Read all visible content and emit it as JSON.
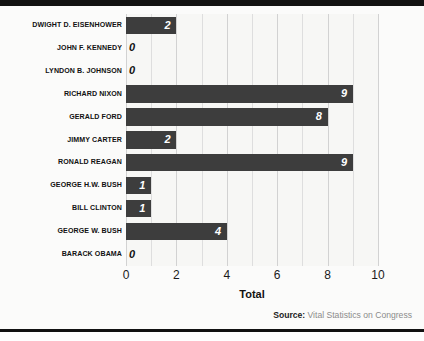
{
  "chart_data": {
    "type": "bar",
    "orientation": "horizontal",
    "title": "",
    "xlabel": "Total",
    "ylabel": "",
    "xlim": [
      0,
      10
    ],
    "grid": true,
    "legend": false,
    "categories": [
      "DWIGHT D. EISENHOWER",
      "JOHN F. KENNEDY",
      "LYNDON B. JOHNSON",
      "RICHARD NIXON",
      "GERALD FORD",
      "JIMMY CARTER",
      "RONALD REAGAN",
      "GEORGE H.W. BUSH",
      "BILL CLINTON",
      "GEORGE W. BUSH",
      "BARACK OBAMA"
    ],
    "values": [
      2,
      0,
      0,
      9,
      8,
      2,
      9,
      1,
      1,
      4,
      0
    ],
    "value_labels": [
      "2",
      "0",
      "0",
      "9",
      "8",
      "2",
      "9",
      "1",
      "1",
      "4",
      "0"
    ],
    "xticks": [
      0,
      2,
      4,
      6,
      8,
      10
    ],
    "xtick_labels": [
      "0",
      "2",
      "4",
      "6",
      "8",
      "10"
    ],
    "gridline_step": 1,
    "bar_color": "#3d3d3d",
    "inside_label_color": "#ffffff",
    "outside_label_color": "#111111",
    "plot_background": "#f7f7f5",
    "gridline_color": "#dedede"
  },
  "axis": {
    "title": "Total"
  },
  "source": {
    "label": "Source:",
    "text": " Vital Statistics on Congress"
  },
  "colors": {
    "rule": "#121212",
    "bar": "#3d3d3d",
    "grid": "#dedede",
    "source_text": "#8b8b8b"
  }
}
